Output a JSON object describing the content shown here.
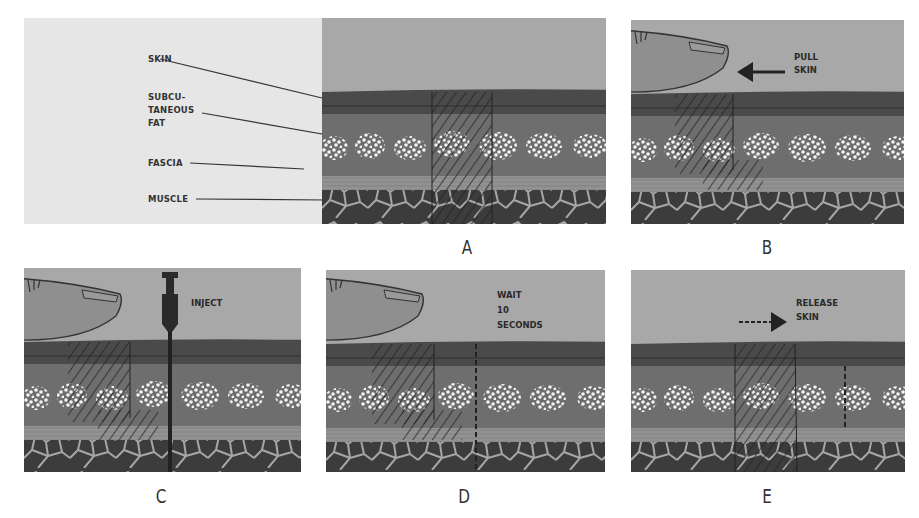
{
  "figure": {
    "layer_labels": [
      "SKIN",
      "SUBCU-",
      "TANEOUS",
      "FAT",
      "FASCIA",
      "MUSCLE"
    ],
    "panels": [
      {
        "id": "A",
        "caption": "A",
        "instruction": ""
      },
      {
        "id": "B",
        "caption": "B",
        "instruction_lines": [
          "PULL",
          "SKIN"
        ]
      },
      {
        "id": "C",
        "caption": "C",
        "instruction_lines": [
          "INJECT"
        ]
      },
      {
        "id": "D",
        "caption": "D",
        "instruction_lines": [
          "WAIT",
          "10",
          "SECONDS"
        ]
      },
      {
        "id": "E",
        "caption": "E",
        "instruction_lines": [
          "RELEASE",
          "SKIN"
        ]
      }
    ]
  },
  "colors": {
    "air": "#a8a8a8",
    "skin": "#4a4a4a",
    "subcutaneous": "#6e6e6e",
    "fat_globule": "#f2f2f2",
    "fascia": "#8a8a8a",
    "muscle": "#3c3c3c",
    "muscle_lines": "#a0a0a0",
    "label_panel": "#e6e6e6"
  }
}
